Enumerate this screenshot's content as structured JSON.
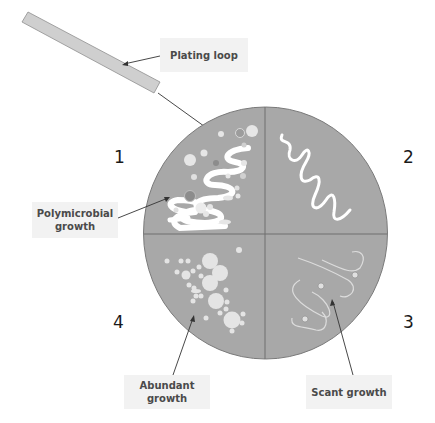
{
  "diagram": {
    "labels": {
      "plating_loop": "Plating loop",
      "polymicrobial": "Polymicrobial growth",
      "polymicrobial_line1": "Polymicrobial",
      "polymicrobial_line2": "growth",
      "abundant": "Abundant growth",
      "scant": "Scant growth"
    },
    "quadrants": [
      {
        "number": "1",
        "description": "Polymicrobial growth"
      },
      {
        "number": "2",
        "description": "Streak"
      },
      {
        "number": "3",
        "description": "Scant growth"
      },
      {
        "number": "4",
        "description": "Abundant growth"
      }
    ],
    "colors": {
      "plate": "#a6a6a6",
      "plate_edge": "#7a7a7a",
      "divider": "#6e6e6e",
      "streak": "#ffffff",
      "colony_light": "#e4e4e4",
      "colony_dark": "#8c8c8c",
      "loop": "#c8c8c8",
      "label_bg": "#f2f2f2",
      "label_text": "#4a4a4a"
    }
  }
}
